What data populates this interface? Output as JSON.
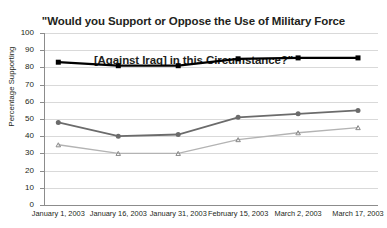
{
  "chart_data": {
    "type": "line",
    "title_lines": [
      "\"Would you Support or Oppose the Use of Military Force",
      "[Against Iraq] in this Circumstance?\""
    ],
    "title": "\"Would you Support or Oppose the Use of Military Force [Against Iraq] in this Circumstance?\"",
    "xlabel": "",
    "ylabel": "Percentage Supporting",
    "ylim": [
      0,
      100
    ],
    "ytick_values": [
      0,
      10,
      20,
      30,
      40,
      50,
      60,
      70,
      80,
      90,
      100
    ],
    "ytick_labels": [
      "0",
      "10",
      "20",
      "30",
      "40",
      "50",
      "60",
      "70",
      "80",
      "90",
      "100"
    ],
    "categories": [
      "January 1, 2003",
      "January 16, 2003",
      "January 31, 2003",
      "February 15, 2003",
      "March 2, 2003",
      "March 17, 2003"
    ],
    "x_positions_pct": [
      4,
      22,
      40,
      58,
      76,
      94
    ],
    "grid": true,
    "legend": "none",
    "series": [
      {
        "name": "series-1-top",
        "marker": "square",
        "color": "#000000",
        "line_width": 2.2,
        "marker_size": 5,
        "values": [
          83,
          81,
          81,
          85,
          85.5,
          85.5
        ]
      },
      {
        "name": "series-2-middle",
        "marker": "circle",
        "color": "#6b6b6b",
        "line_width": 1.8,
        "marker_size": 5,
        "values": [
          48,
          40,
          41,
          51,
          53,
          55
        ]
      },
      {
        "name": "series-3-bottom",
        "marker": "triangle",
        "color": "#b3b3b3",
        "line_width": 1.4,
        "marker_size": 4.5,
        "values": [
          35,
          30,
          30,
          38,
          42,
          45
        ]
      }
    ]
  }
}
